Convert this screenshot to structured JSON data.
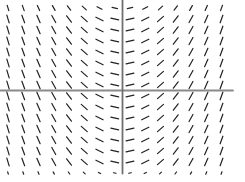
{
  "page": {
    "width": 245,
    "height": 182,
    "background_color": "#ffffff"
  },
  "chart_data": {
    "type": "line",
    "subtype": "slope_field",
    "title": "",
    "xlabel": "",
    "ylabel": "",
    "tick_labels": "none",
    "grid_lines": "off",
    "legend": "none",
    "axes": {
      "x_axis": {
        "y_px": 90.5,
        "x_start_px": 0,
        "x_end_px": 233,
        "color": "#8a8a8a",
        "width_px": 1.8
      },
      "y_axis": {
        "x_px": 122.5,
        "y_start_px": 0,
        "y_end_px": 173.5,
        "color": "#6f6f6f",
        "width_px": 1.8
      }
    },
    "grid": {
      "n_columns": 15,
      "n_rows": 16,
      "columns_x_px": [
        8,
        23.25,
        38.5,
        53.75,
        69,
        84.25,
        99.5,
        114.75,
        130,
        145.25,
        160.5,
        175.75,
        191,
        206.25,
        221.5
      ],
      "rows_y_px": [
        8,
        19,
        30,
        41,
        52,
        63,
        74,
        85,
        96,
        107,
        118,
        129,
        140,
        151,
        162,
        173
      ]
    },
    "segments": {
      "angle_deg_by_column": [
        -73,
        -70,
        -66,
        -61,
        -53,
        -42,
        -27,
        -13,
        13,
        27,
        42,
        53,
        61,
        66,
        70
      ],
      "angle_convention": "degrees counterclockwise from horizontal; positive rises to the right",
      "length_px_default": 8,
      "length_px_by_row_override": {
        "0": 5.5,
        "15": 2.5
      },
      "color": "#222222",
      "stroke_width_px": 1.2
    }
  }
}
